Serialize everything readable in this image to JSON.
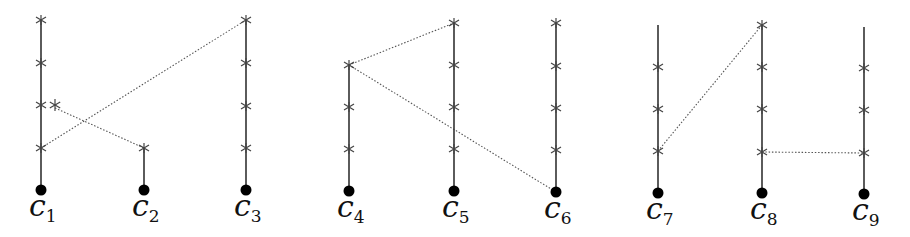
{
  "diagram": {
    "title": "",
    "groups": [
      {
        "id": "group-1",
        "chains": [
          {
            "label": "c",
            "subscript": "1",
            "x": 41,
            "line_top": 20,
            "dot_y": 190,
            "crosses": [
              20,
              63,
              105,
              148
            ]
          },
          {
            "label": "c",
            "subscript": "2",
            "x": 144,
            "line_top": 148,
            "dot_y": 190,
            "crosses": [
              148
            ]
          },
          {
            "label": "c",
            "subscript": "3",
            "x": 246,
            "line_top": 20,
            "dot_y": 190,
            "crosses": [
              20,
              63,
              106,
              148
            ]
          }
        ],
        "extra_points": [
          {
            "x": 55,
            "y": 105,
            "symbol": "asterisk"
          }
        ],
        "dotted_edges": [
          {
            "from": [
              41,
              148
            ],
            "to": [
              246,
              20
            ]
          },
          {
            "from": [
              55,
              108
            ],
            "to": [
              144,
              148
            ]
          }
        ]
      },
      {
        "id": "group-2",
        "chains": [
          {
            "label": "c",
            "subscript": "4",
            "x": 349,
            "line_top": 65,
            "dot_y": 191,
            "crosses": [
              65,
              107,
              149
            ]
          },
          {
            "label": "c",
            "subscript": "5",
            "x": 454,
            "line_top": 23,
            "dot_y": 191,
            "crosses": [
              23,
              65,
              107,
              149
            ]
          },
          {
            "label": "c",
            "subscript": "6",
            "x": 556,
            "line_top": 23,
            "dot_y": 192,
            "crosses": [
              23,
              66,
              108,
              150
            ]
          }
        ],
        "extra_points": [],
        "dotted_edges": [
          {
            "from": [
              349,
              65
            ],
            "to": [
              454,
              23
            ]
          },
          {
            "from": [
              349,
              65
            ],
            "to": [
              556,
              192
            ]
          }
        ]
      },
      {
        "id": "group-3",
        "chains": [
          {
            "label": "c",
            "subscript": "7",
            "x": 658,
            "line_top": 25,
            "dot_y": 193,
            "crosses": [
              67,
              109,
              151
            ]
          },
          {
            "label": "c",
            "subscript": "8",
            "x": 762,
            "line_top": 25,
            "dot_y": 193,
            "crosses": [
              25,
              67,
              109,
              152
            ]
          },
          {
            "label": "c",
            "subscript": "9",
            "x": 864,
            "line_top": 27,
            "dot_y": 194,
            "crosses": [
              68,
              110,
              153
            ]
          }
        ],
        "extra_points": [],
        "dotted_edges": [
          {
            "from": [
              658,
              151
            ],
            "to": [
              762,
              25
            ]
          },
          {
            "from": [
              762,
              152
            ],
            "to": [
              864,
              153
            ]
          }
        ]
      }
    ],
    "colors": {
      "line": "#333333",
      "cross": "#444444",
      "dot": "#000000",
      "dotted": "#555555"
    }
  }
}
